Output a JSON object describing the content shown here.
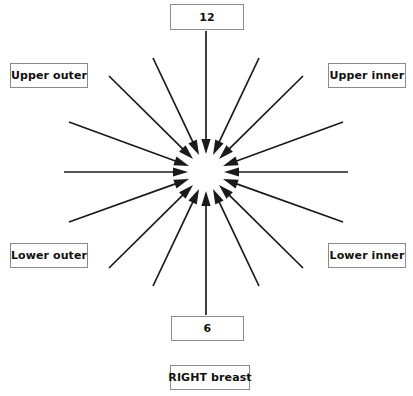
{
  "diagram": {
    "title_box": {
      "label": "RIGHT breast"
    },
    "clock_top": {
      "label": "12"
    },
    "clock_bottom": {
      "label": "6"
    },
    "quadrants": [
      {
        "key": "upper_outer",
        "label": "Upper outer"
      },
      {
        "key": "upper_inner",
        "label": "Upper inner"
      },
      {
        "key": "lower_outer",
        "label": "Lower outer"
      },
      {
        "key": "lower_inner",
        "label": "Lower inner"
      }
    ],
    "colors": {
      "arrow": "#1a1a1a",
      "box_border": "#8a8a8a",
      "box_fill": "#ffffff",
      "text": "#111111",
      "background": "#ffffff"
    },
    "geometry": {
      "center_x": 206,
      "center_y": 172,
      "inner_radius": 18,
      "arrow_count": 16,
      "arrows": [
        {
          "name": "arrow-12-oclock",
          "angle_deg": -90,
          "tail_x": 206,
          "tail_y": 31,
          "tip_x": 206,
          "tip_y": 154
        },
        {
          "name": "arrow-1-oclock",
          "angle_deg": -67.5,
          "tail_x": 259,
          "tail_y": 58,
          "tip_x": 213,
          "tip_y": 155
        },
        {
          "name": "arrow-2-oclock",
          "angle_deg": -45,
          "tail_x": 303,
          "tail_y": 76,
          "tip_x": 219,
          "tip_y": 159
        },
        {
          "name": "arrow-3-half-oclock",
          "angle_deg": -22.5,
          "tail_x": 343,
          "tail_y": 122,
          "tip_x": 223,
          "tip_y": 166
        },
        {
          "name": "arrow-3-oclock",
          "angle_deg": 0,
          "tail_x": 348,
          "tail_y": 172,
          "tip_x": 224,
          "tip_y": 172
        },
        {
          "name": "arrow-4-oclock",
          "angle_deg": 22.5,
          "tail_x": 343,
          "tail_y": 222,
          "tip_x": 223,
          "tip_y": 179
        },
        {
          "name": "arrow-5-oclock",
          "angle_deg": 45,
          "tail_x": 303,
          "tail_y": 268,
          "tip_x": 219,
          "tip_y": 185
        },
        {
          "name": "arrow-5-half-oclock",
          "angle_deg": 67.5,
          "tail_x": 259,
          "tail_y": 286,
          "tip_x": 213,
          "tip_y": 189
        },
        {
          "name": "arrow-6-oclock",
          "angle_deg": 90,
          "tail_x": 206,
          "tail_y": 315,
          "tip_x": 206,
          "tip_y": 191
        },
        {
          "name": "arrow-7-oclock",
          "angle_deg": 112.5,
          "tail_x": 153,
          "tail_y": 286,
          "tip_x": 199,
          "tip_y": 189
        },
        {
          "name": "arrow-8-oclock",
          "angle_deg": 135,
          "tail_x": 109,
          "tail_y": 268,
          "tip_x": 193,
          "tip_y": 185
        },
        {
          "name": "arrow-8-half-oclock",
          "angle_deg": 157.5,
          "tail_x": 69,
          "tail_y": 222,
          "tip_x": 189,
          "tip_y": 179
        },
        {
          "name": "arrow-9-oclock",
          "angle_deg": 180,
          "tail_x": 64,
          "tail_y": 172,
          "tip_x": 188,
          "tip_y": 172
        },
        {
          "name": "arrow-10-oclock",
          "angle_deg": 202.5,
          "tail_x": 69,
          "tail_y": 122,
          "tip_x": 189,
          "tip_y": 166
        },
        {
          "name": "arrow-11-oclock",
          "angle_deg": 225,
          "tail_x": 109,
          "tail_y": 76,
          "tip_x": 193,
          "tip_y": 159
        },
        {
          "name": "arrow-11-half-oclock",
          "angle_deg": 247.5,
          "tail_x": 153,
          "tail_y": 58,
          "tip_x": 199,
          "tip_y": 155
        }
      ]
    }
  }
}
